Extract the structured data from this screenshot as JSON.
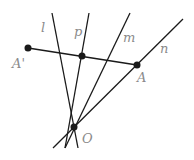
{
  "diagram": {
    "lines": [
      {
        "id": "l",
        "label": "l",
        "x1": 52,
        "y1": 13,
        "x2": 78,
        "y2": 148,
        "label_x": 41,
        "label_y": 32
      },
      {
        "id": "p",
        "label": "p",
        "x1": 89,
        "y1": 13,
        "x2": 65,
        "y2": 148,
        "label_x": 74,
        "label_y": 36
      },
      {
        "id": "m",
        "label": "m",
        "x1": 130,
        "y1": 13,
        "x2": 65,
        "y2": 148,
        "label_x": 123,
        "label_y": 42
      },
      {
        "id": "n",
        "label": "n",
        "x1": 183,
        "y1": 19,
        "x2": 53,
        "y2": 148,
        "label_x": 160,
        "label_y": 53
      },
      {
        "id": "AA",
        "label": "",
        "x1": 28,
        "y1": 48,
        "x2": 137,
        "y2": 65
      }
    ],
    "points": [
      {
        "id": "A_prime",
        "label": "A'",
        "x": 28,
        "y": 48,
        "label_x": 12,
        "label_y": 68
      },
      {
        "id": "P",
        "label": "",
        "x": 82,
        "y": 56
      },
      {
        "id": "A",
        "label": "A",
        "x": 137,
        "y": 65,
        "label_x": 137,
        "label_y": 82
      },
      {
        "id": "O",
        "label": "O",
        "x": 74,
        "y": 127,
        "label_x": 82,
        "label_y": 143
      }
    ],
    "colors": {
      "line": "#1a1a1a",
      "label": "#8a8a8a"
    }
  }
}
